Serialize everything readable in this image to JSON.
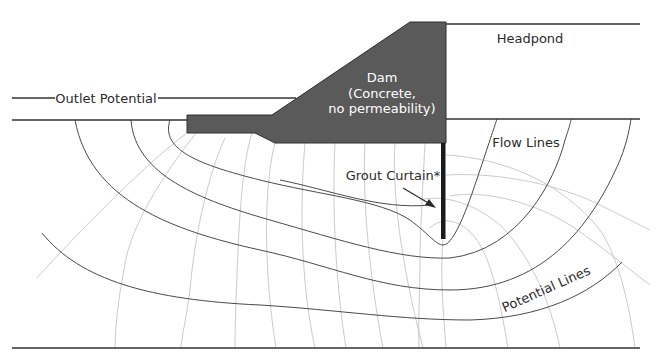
{
  "diagram": {
    "labels": {
      "headpond": "Headpond",
      "outlet_potential": "Outlet Potential",
      "dam_line1": "Dam",
      "dam_line2": "(Concrete,",
      "dam_line3": "no permeability)",
      "flow_lines": "Flow Lines",
      "grout_curtain": "Grout Curtain*",
      "potential_lines": "Potential Lines"
    },
    "colors": {
      "dam_fill": "#5a5a5a",
      "flow_line": "#4a4a4a",
      "potential_line": "#c4c4c4",
      "boundary": "#333333",
      "grout_curtain": "#1a1a1a"
    },
    "elements": {
      "flow_line_count": 5,
      "potential_line_count": 14
    }
  }
}
